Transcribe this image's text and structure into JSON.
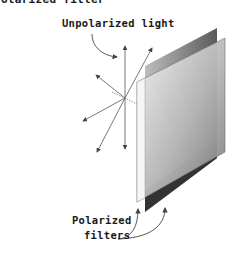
{
  "figure": {
    "title_partial": "Polarized filter",
    "labels": {
      "unpolarized_light": "Unpolarized light",
      "polarized_line1": "Polarized",
      "polarized_line2": "filters"
    },
    "colors": {
      "line": "#444444",
      "panel_dark": "#3a3a3a",
      "panel_light": "#d8d8d8",
      "text": "#1a1a1a"
    }
  }
}
